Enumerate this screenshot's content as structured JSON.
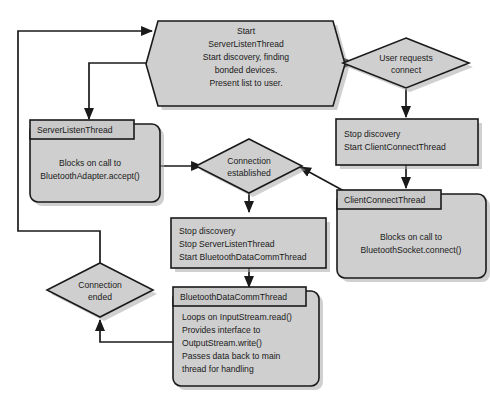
{
  "diagram": {
    "type": "flowchart",
    "colors": {
      "node_fill": "#cfcfcf",
      "node_stroke": "#1a1a1a",
      "shadow": "#aaaaaa",
      "background": "#ffffff"
    },
    "nodes": {
      "start": {
        "shape": "hexagon",
        "lines": [
          "Start",
          "ServerListenThread",
          "Start discovery, finding",
          "bonded devices.",
          "Present list to user."
        ]
      },
      "user_requests_connect": {
        "shape": "diamond",
        "lines": [
          "User requests",
          "connect"
        ]
      },
      "stop_discovery_start_client": {
        "shape": "rectangle",
        "lines": [
          "Stop discovery",
          "Start ClientConnectThread"
        ]
      },
      "client_connect_thread": {
        "shape": "thread-box",
        "tab_label": "ClientConnectThread",
        "lines": [
          "Blocks on call to",
          "BluetoothSocket.connect()"
        ]
      },
      "server_listen_thread": {
        "shape": "thread-box",
        "tab_label": "ServerListenThread",
        "lines": [
          "Blocks on call to",
          "BluetoothAdapter.accept()"
        ]
      },
      "connection_established": {
        "shape": "diamond",
        "lines": [
          "Connection",
          "established"
        ]
      },
      "stop_discovery_start_comm": {
        "shape": "rectangle",
        "lines": [
          "Stop discovery",
          "Stop ServerListenThread",
          "Start BluetoothDataCommThread"
        ]
      },
      "bluetooth_data_comm_thread": {
        "shape": "thread-box",
        "tab_label": "BluetoothDataCommThread",
        "lines": [
          "Loops on InputStream.read()",
          "Provides interface to",
          "OutputStream.write()",
          "Passes data back to main",
          "thread for handling"
        ]
      },
      "connection_ended": {
        "shape": "diamond",
        "lines": [
          "Connection",
          "ended"
        ]
      }
    },
    "edges": [
      {
        "from": "start",
        "to": "user_requests_connect"
      },
      {
        "from": "start",
        "to": "server_listen_thread"
      },
      {
        "from": "user_requests_connect",
        "to": "stop_discovery_start_client"
      },
      {
        "from": "stop_discovery_start_client",
        "to": "client_connect_thread"
      },
      {
        "from": "client_connect_thread",
        "to": "connection_established"
      },
      {
        "from": "server_listen_thread",
        "to": "connection_established"
      },
      {
        "from": "connection_established",
        "to": "stop_discovery_start_comm"
      },
      {
        "from": "stop_discovery_start_comm",
        "to": "bluetooth_data_comm_thread"
      },
      {
        "from": "bluetooth_data_comm_thread",
        "to": "connection_ended"
      },
      {
        "from": "connection_ended",
        "to": "start"
      }
    ]
  }
}
